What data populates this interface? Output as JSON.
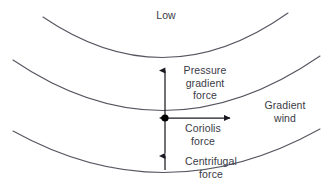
{
  "diagram": {
    "type": "meteorology-force-balance",
    "title_label": "Low",
    "labels": {
      "low": "Low",
      "pressure_gradient_force_line1": "Pressure",
      "pressure_gradient_force_line2": "gradient",
      "pressure_gradient_force_line3": "force",
      "coriolis_force_line1": "Coriolis",
      "coriolis_force_line2": "force",
      "centrifugal_force_line1": "Centrifugal",
      "centrifugal_force_line2": "force",
      "gradient_wind_line1": "Gradient",
      "gradient_wind_line2": "wind"
    },
    "colors": {
      "background": "#ffffff",
      "isobar_stroke": "#555560",
      "arrow_stroke": "#1a1a22",
      "text": "#3a3a46",
      "point_fill": "#000000"
    },
    "isobars": [
      {
        "name": "isobar-top",
        "path": "M 43 17 Q 165 100 288 13"
      },
      {
        "name": "isobar-middle",
        "path": "M 13 60 Q 165 163 320 56"
      },
      {
        "name": "isobar-bottom",
        "path": "M 13 131 Q 165 215 320 129"
      }
    ],
    "arrows": [
      {
        "name": "pressure-gradient-force-arrow",
        "direction": "up",
        "x": 165,
        "from_y": 118,
        "to_y": 67
      },
      {
        "name": "coriolis-force-arrow",
        "direction": "down",
        "x": 165,
        "from_y": 118,
        "to_y": 156
      },
      {
        "name": "centrifugal-force-arrow",
        "direction": "down",
        "x": 165,
        "from_y": 118,
        "to_y": 173
      },
      {
        "name": "gradient-wind-arrow",
        "direction": "right",
        "y": 118,
        "from_x": 165,
        "to_x": 233
      }
    ],
    "parcel_point": {
      "cx": 165,
      "cy": 118,
      "r": 3.6
    }
  }
}
